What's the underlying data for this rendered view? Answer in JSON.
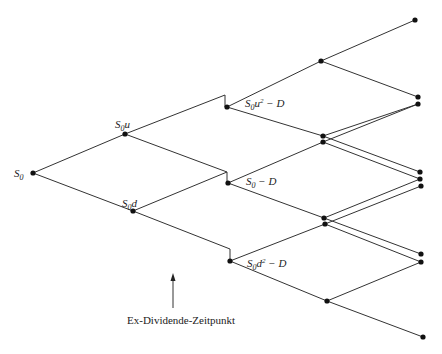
{
  "diagram": {
    "type": "binomial-tree",
    "labels": {
      "root": {
        "base": "S",
        "sub": "0",
        "rest": ""
      },
      "up": {
        "base": "S",
        "sub": "0",
        "rest": "u"
      },
      "down": {
        "base": "S",
        "sub": "0",
        "rest": "d"
      },
      "exdiv_top": {
        "base": "S",
        "sub": "0",
        "rest": "u",
        "sup": "2",
        "tail": " − D"
      },
      "exdiv_mid": {
        "base": "S",
        "sub": "0",
        "rest": "",
        "tail": " − D"
      },
      "exdiv_bot": {
        "base": "S",
        "sub": "0",
        "rest": "d",
        "sup": "2",
        "tail": " − D"
      }
    },
    "caption": "Ex-Dividende-Zeitpunkt",
    "colors": {
      "line": "#333333",
      "node": "#111111",
      "text": "#222222"
    }
  }
}
